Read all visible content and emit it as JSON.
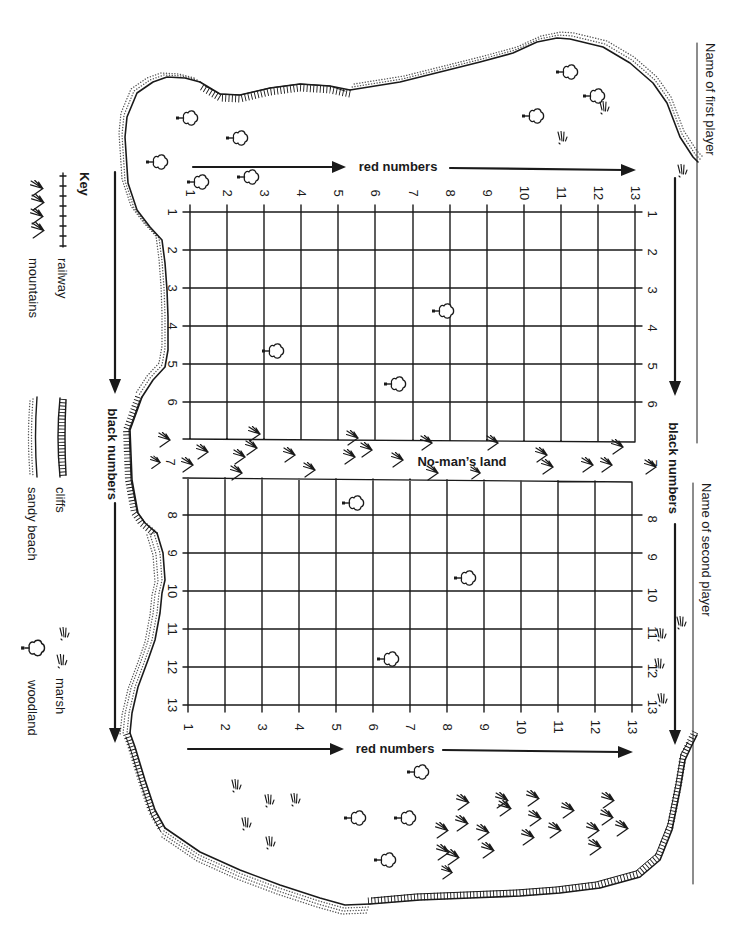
{
  "players": {
    "first": "Name of first player",
    "second": "Name of second player"
  },
  "axes": {
    "red_label": "red numbers",
    "black_label": "black numbers",
    "columns": [
      "1",
      "2",
      "3",
      "4",
      "5",
      "6",
      "7",
      "8",
      "9",
      "10",
      "11",
      "12",
      "13"
    ],
    "rows": [
      "1",
      "2",
      "3",
      "4",
      "5",
      "6",
      "7",
      "8",
      "9",
      "10",
      "11",
      "12",
      "13"
    ]
  },
  "no_mans_land": "No-man’s land",
  "key": {
    "title": "Key",
    "items": [
      {
        "label": "railway",
        "icon": "railway-icon"
      },
      {
        "label": "mountains",
        "icon": "mountains-icon"
      },
      {
        "label": "cliffs",
        "icon": "cliffs-icon"
      },
      {
        "label": "sandy beach",
        "icon": "sandy-beach-icon"
      },
      {
        "label": "marsh",
        "icon": "marsh-icon"
      },
      {
        "label": "woodland",
        "icon": "woodland-icon"
      }
    ]
  },
  "colors": {
    "ink": "#1a1a1a",
    "paper": "#ffffff",
    "sand": "#555555"
  }
}
